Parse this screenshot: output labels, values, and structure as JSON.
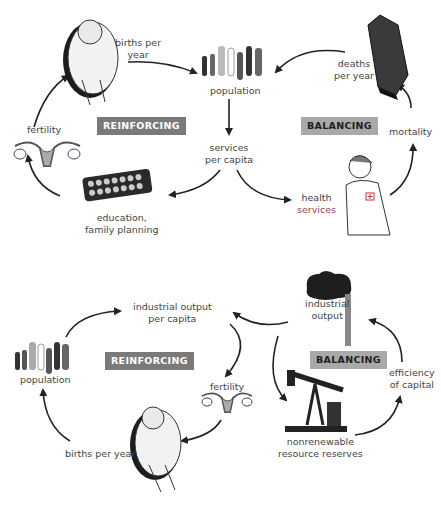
{
  "diagrams": [
    {
      "id": "top",
      "loops": [
        {
          "type": "reinforcing",
          "label": "REINFORCING"
        },
        {
          "type": "balancing",
          "label": "BALANCING"
        }
      ],
      "nodes": {
        "births": "births per\nyear",
        "births_l1": "births per",
        "births_l2": "year",
        "population": "population",
        "deaths_l1": "deaths",
        "deaths_l2": "per year",
        "mortality": "mortality",
        "fertility": "fertility",
        "services_l1": "services",
        "services_l2": "per capita",
        "education_l1": "education,",
        "education_l2": "family planning",
        "health_l1": "health",
        "health_l2": "services"
      },
      "links": [
        [
          "births per year",
          "population"
        ],
        [
          "deaths per year",
          "population"
        ],
        [
          "population",
          "services per capita"
        ],
        [
          "services per capita",
          "education, family planning"
        ],
        [
          "services per capita",
          "health services"
        ],
        [
          "education, family planning",
          "fertility"
        ],
        [
          "fertility",
          "births per year"
        ],
        [
          "health services",
          "mortality"
        ],
        [
          "mortality",
          "deaths per year"
        ]
      ]
    },
    {
      "id": "bottom",
      "loops": [
        {
          "type": "reinforcing",
          "label": "REINFORCING"
        },
        {
          "type": "balancing",
          "label": "BALANCING"
        }
      ],
      "nodes": {
        "iopc_l1": "industrial output",
        "iopc_l2": "per capita",
        "population": "population",
        "fertility": "fertility",
        "births": "births per year",
        "io_l1": "industrial",
        "io_l2": "output",
        "efficiency_l1": "efficiency",
        "efficiency_l2": "of capital",
        "resources_l1": "nonrenewable",
        "resources_l2": "resource reserves"
      },
      "links": [
        [
          "population",
          "industrial output per capita"
        ],
        [
          "industrial output per capita",
          "fertility"
        ],
        [
          "fertility",
          "births per year"
        ],
        [
          "births per year",
          "population"
        ],
        [
          "industrial output",
          "industrial output per capita"
        ],
        [
          "industrial output",
          "nonrenewable resource reserves"
        ],
        [
          "nonrenewable resource reserves",
          "efficiency of capital"
        ],
        [
          "efficiency of capital",
          "industrial output"
        ]
      ]
    }
  ],
  "colors": {
    "reinforcing_badge": "#7a7a7a",
    "balancing_badge": "#a9a9a9",
    "arrow": "#222222",
    "label": "#444444"
  }
}
